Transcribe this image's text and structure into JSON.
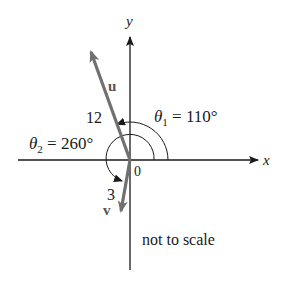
{
  "figure": {
    "axes": {
      "x_label": "x",
      "y_label": "y",
      "origin_label": "0"
    },
    "vectors": [
      {
        "name": "u",
        "magnitude_label": "12",
        "angle_deg": 110
      },
      {
        "name": "v",
        "magnitude_label": "3",
        "angle_deg": 260
      }
    ],
    "angles": {
      "theta1": {
        "symbol": "θ",
        "subscript": "1",
        "text": " = 110°"
      },
      "theta2": {
        "symbol": "θ",
        "subscript": "2",
        "text": " = 260°"
      }
    },
    "note": "not to scale",
    "colors": {
      "axis": "#1a1a1a",
      "vector": "#707070"
    }
  }
}
